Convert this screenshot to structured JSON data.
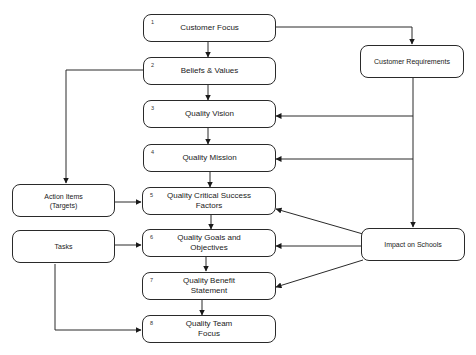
{
  "diagram": {
    "main_steps": [
      {
        "num": "1",
        "label": "Customer Focus"
      },
      {
        "num": "2",
        "label": "Beliefs & Values"
      },
      {
        "num": "3",
        "label": "Quality Vision"
      },
      {
        "num": "4",
        "label": "Quality Mission"
      },
      {
        "num": "5",
        "label": "Quality Critical Success\nFactors"
      },
      {
        "num": "6",
        "label": "Quality Goals and\nObjectives"
      },
      {
        "num": "7",
        "label": "Quality Benefit\nStatement"
      },
      {
        "num": "8",
        "label": "Quality Team\nFocus"
      }
    ],
    "side_boxes": {
      "customer_requirements": "Customer Requirements",
      "impact_on_schools": "Impact on Schools",
      "action_items": "Action Items\n(Targets)",
      "tasks": "Tasks"
    },
    "connections": [
      {
        "from": "Customer Focus",
        "to": "Beliefs & Values"
      },
      {
        "from": "Beliefs & Values",
        "to": "Quality Vision"
      },
      {
        "from": "Quality Vision",
        "to": "Quality Mission"
      },
      {
        "from": "Quality Mission",
        "to": "Quality Critical Success Factors"
      },
      {
        "from": "Quality Critical Success Factors",
        "to": "Quality Goals and Objectives"
      },
      {
        "from": "Quality Goals and Objectives",
        "to": "Quality Benefit Statement"
      },
      {
        "from": "Quality Benefit Statement",
        "to": "Quality Team Focus"
      },
      {
        "from": "Customer Focus",
        "to": "Customer Requirements"
      },
      {
        "from": "Customer Requirements",
        "to": "Quality Vision"
      },
      {
        "from": "Customer Requirements",
        "to": "Quality Mission"
      },
      {
        "from": "Customer Requirements",
        "to": "Impact on Schools"
      },
      {
        "from": "Impact on Schools",
        "to": "Quality Critical Success Factors"
      },
      {
        "from": "Impact on Schools",
        "to": "Quality Goals and Objectives"
      },
      {
        "from": "Impact on Schools",
        "to": "Quality Benefit Statement"
      },
      {
        "from": "Beliefs & Values",
        "to": "Action Items (Targets)"
      },
      {
        "from": "Action Items (Targets)",
        "to": "Quality Critical Success Factors"
      },
      {
        "from": "Tasks",
        "to": "Quality Goals and Objectives"
      },
      {
        "from": "Tasks",
        "to": "Quality Team Focus"
      }
    ]
  }
}
